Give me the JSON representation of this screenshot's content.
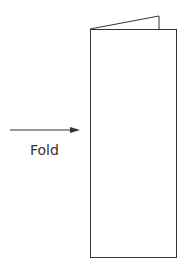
{
  "diagram": {
    "label": "Fold",
    "colors": {
      "stroke": "#333333",
      "background": "#ffffff"
    }
  }
}
